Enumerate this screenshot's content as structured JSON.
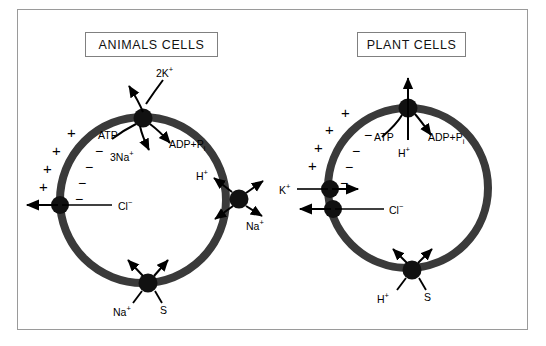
{
  "figure": {
    "frame_color": "#9a9a9a",
    "background": "#ffffff",
    "membrane_color": "#3a3a3a",
    "panels": [
      {
        "id": "animal",
        "title": "ANIMALS CELLS",
        "cell": {
          "cx": 143,
          "cy": 200,
          "r": 83
        },
        "charges": {
          "outside_symbol": "+",
          "inside_symbol": "−",
          "outside_count": 4,
          "inside_count": 4
        },
        "transporters": [
          {
            "name": "sodium-potassium-atpase",
            "label_main": "2K",
            "label_charge": "+",
            "labels": [
              "2K⁺",
              "ATP",
              "3Na⁺",
              "ADP+Pᵢ"
            ],
            "position": "top",
            "species_in": "2K⁺",
            "species_out": "3Na⁺",
            "energy_in": "ATP",
            "energy_out": "ADP+Pᵢ"
          },
          {
            "name": "chloride-transporter",
            "labels": [
              "Cl⁻"
            ],
            "position": "left",
            "direction": "outward"
          },
          {
            "name": "sodium-proton-antiporter",
            "labels": [
              "H⁺",
              "Na⁺"
            ],
            "position": "right",
            "species_in": "Na⁺",
            "species_out": "H⁺"
          },
          {
            "name": "sodium-solute-symporter",
            "labels": [
              "Na⁺",
              "S"
            ],
            "position": "bottom",
            "direction": "inward"
          }
        ]
      },
      {
        "id": "plant",
        "title": "PLANT CELLS",
        "cell": {
          "cx": 408,
          "cy": 188,
          "r": 80
        },
        "charges": {
          "outside_symbol": "+",
          "inside_symbol": "−",
          "outside_count": 4,
          "inside_count": 4
        },
        "transporters": [
          {
            "name": "proton-atpase",
            "labels": [
              "ATP",
              "H⁺",
              "ADP+Pᵢ"
            ],
            "position": "top",
            "species_out": "H⁺",
            "energy_in": "ATP",
            "energy_out": "ADP+Pᵢ"
          },
          {
            "name": "potassium-channel",
            "labels": [
              "K⁺"
            ],
            "position": "left-upper",
            "direction": "inward"
          },
          {
            "name": "chloride-transporter",
            "labels": [
              "Cl⁻"
            ],
            "position": "left-lower",
            "direction": "outward"
          },
          {
            "name": "proton-solute-symporter",
            "labels": [
              "H⁺",
              "S"
            ],
            "position": "bottom",
            "direction": "inward"
          }
        ]
      }
    ],
    "labels": {
      "animal": {
        "k2": "2K",
        "k2_sup": "+",
        "atp": "ATP",
        "na3": "3Na",
        "na3_sup": "+",
        "adp": "ADP+P",
        "adp_sub": "i",
        "cl": "Cl",
        "cl_sup": "−",
        "h": "H",
        "h_sup": "+",
        "na_right": "Na",
        "na_right_sup": "+",
        "na_bottom": "Na",
        "na_bottom_sup": "+",
        "s_bottom": "S"
      },
      "plant": {
        "atp": "ATP",
        "h_top": "H",
        "h_top_sup": "+",
        "adp": "ADP+P",
        "adp_sub": "i",
        "k": "K",
        "k_sup": "+",
        "cl": "Cl",
        "cl_sup": "−",
        "h_bottom": "H",
        "h_bottom_sup": "+",
        "s_bottom": "S"
      }
    }
  }
}
